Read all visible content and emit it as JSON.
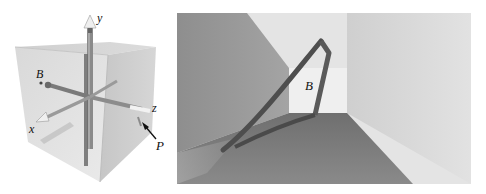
{
  "figure": {
    "left_panel": {
      "description": "Translucent cube with coordinate axes",
      "labels": {
        "y_axis": "y",
        "z_axis": "z",
        "x_axis": "x",
        "point_b": "B",
        "point_p": "P"
      }
    },
    "right_panel": {
      "description": "Interior view of room with triangular object",
      "labels": {
        "object_b": "B"
      }
    },
    "colors": {
      "cube_face_light": "#d4d4d4",
      "cube_face_mid": "#c4c4c4",
      "axis_rod": "#8a8a8a",
      "wall_left": "#9a9a9a",
      "wall_right": "#dedede",
      "back_wall": "#ececec",
      "floor": "#7c7c7c",
      "triangle_object": "#555555"
    }
  }
}
